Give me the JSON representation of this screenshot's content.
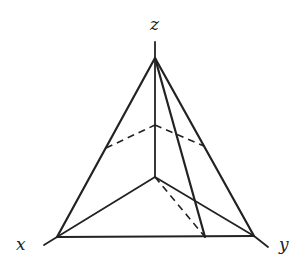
{
  "diagram": {
    "title": "",
    "labels": {
      "z": "z",
      "x": "x",
      "y": "y"
    },
    "points": {
      "apex_z": [
        155,
        58
      ],
      "z_axis_top": [
        155,
        42
      ],
      "base_x": [
        57,
        237
      ],
      "x_axis_end": [
        44,
        245
      ],
      "base_y": [
        254,
        236
      ],
      "y_axis_end": [
        268,
        247
      ],
      "origin": [
        155,
        177
      ],
      "mid_z": [
        155,
        125
      ],
      "mid_zx": [
        106,
        148
      ],
      "mid_zy": [
        204,
        146
      ],
      "base_foot": [
        205,
        237
      ]
    },
    "colors": {
      "line": "#222222",
      "background": "#ffffff"
    }
  }
}
